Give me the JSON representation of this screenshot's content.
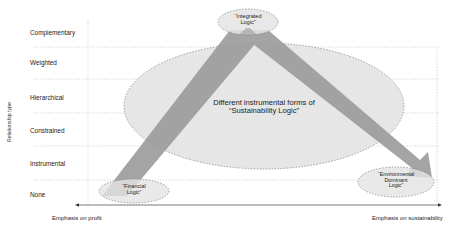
{
  "y_axis": {
    "title": "Relationship type",
    "levels": [
      "Complementary",
      "Weighted",
      "Hierarchical",
      "Constrained",
      "Instrumental",
      "None"
    ]
  },
  "x_axis": {
    "left_label": "Emphasis on profit",
    "right_label": "Emphasis on sustainability"
  },
  "nodes": {
    "integrated": {
      "line1": "“Integrated",
      "line2": "Logic”"
    },
    "center": {
      "line1": "Different instrumental forms of",
      "line2": "“Sustainability Logic”"
    },
    "financial": {
      "line1": "“Financial",
      "line2": "Logic”"
    },
    "environmental": {
      "line1": "“Environmental",
      "line2": "Dominant",
      "line3": "Logic”"
    }
  },
  "colors": {
    "ellipse_fill": "#e4e4e4",
    "ellipse_stroke": "#8a8a8a",
    "arrow_fill": "#9b9b9b",
    "grid": "#c8c8c8",
    "axis": "#555555"
  }
}
